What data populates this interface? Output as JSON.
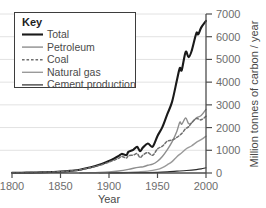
{
  "chart_data": {
    "type": "line",
    "title": "",
    "xlabel": "Year",
    "ylabel": "Million tonnes of carbon / year",
    "xlim": [
      1800,
      2000
    ],
    "ylim": [
      0,
      7000
    ],
    "xticks": [
      1800,
      1850,
      1900,
      1950,
      2000
    ],
    "yticks": [
      0,
      1000,
      2000,
      3000,
      4000,
      5000,
      6000,
      7000
    ],
    "grid": "horizontal",
    "legend_position": "top-left",
    "legend_title": "Key",
    "series": [
      {
        "name": "Total",
        "color": "#1a1a1a",
        "style": "solid",
        "width": 2.1,
        "x": [
          1800,
          1810,
          1820,
          1830,
          1840,
          1850,
          1860,
          1870,
          1880,
          1890,
          1900,
          1905,
          1910,
          1913,
          1918,
          1920,
          1925,
          1929,
          1932,
          1935,
          1940,
          1945,
          1950,
          1955,
          1960,
          1965,
          1970,
          1973,
          1975,
          1979,
          1982,
          1985,
          1990,
          1992,
          1995,
          2000
        ],
        "values": [
          8,
          12,
          18,
          27,
          42,
          60,
          95,
          145,
          240,
          360,
          530,
          630,
          750,
          840,
          790,
          930,
          1020,
          1150,
          960,
          1120,
          1300,
          1160,
          1630,
          2020,
          2580,
          3130,
          4080,
          4620,
          4530,
          5330,
          5100,
          5350,
          6150,
          6100,
          6400,
          6700
        ]
      },
      {
        "name": "Petroleum",
        "color": "#8e8e8e",
        "style": "solid",
        "width": 1.4,
        "x": [
          1870,
          1880,
          1890,
          1900,
          1910,
          1920,
          1930,
          1935,
          1940,
          1945,
          1950,
          1955,
          1960,
          1965,
          1970,
          1973,
          1975,
          1979,
          1982,
          1985,
          1990,
          1995,
          2000
        ],
        "values": [
          3,
          10,
          22,
          45,
          90,
          160,
          250,
          270,
          340,
          390,
          520,
          730,
          1020,
          1370,
          1840,
          2240,
          2150,
          2420,
          2180,
          2200,
          2420,
          2530,
          2800
        ]
      },
      {
        "name": "Coal",
        "color": "#6f6f6f",
        "style": "dashed",
        "width": 1.5,
        "x": [
          1800,
          1820,
          1840,
          1850,
          1860,
          1870,
          1880,
          1890,
          1900,
          1910,
          1913,
          1918,
          1920,
          1925,
          1929,
          1932,
          1935,
          1940,
          1945,
          1950,
          1955,
          1960,
          1965,
          1970,
          1975,
          1979,
          1982,
          1985,
          1990,
          1995,
          2000
        ],
        "values": [
          8,
          18,
          40,
          58,
          92,
          140,
          228,
          335,
          480,
          650,
          730,
          660,
          760,
          790,
          850,
          680,
          790,
          900,
          780,
          1060,
          1180,
          1400,
          1450,
          1570,
          1740,
          1950,
          2030,
          2200,
          2400,
          2340,
          2500
        ]
      },
      {
        "name": "Natural gas",
        "color": "#9a9a9a",
        "style": "solid",
        "width": 1.4,
        "x": [
          1890,
          1900,
          1910,
          1920,
          1930,
          1940,
          1950,
          1955,
          1960,
          1965,
          1970,
          1975,
          1980,
          1985,
          1990,
          1995,
          2000
        ],
        "values": [
          2,
          6,
          14,
          26,
          50,
          80,
          160,
          240,
          360,
          500,
          720,
          890,
          1080,
          1190,
          1350,
          1470,
          1620
        ]
      },
      {
        "name": "Cement production",
        "color": "#2b2b2b",
        "style": "solid",
        "width": 1.2,
        "x": [
          1900,
          1920,
          1940,
          1950,
          1960,
          1970,
          1980,
          1990,
          1995,
          2000
        ],
        "values": [
          5,
          12,
          20,
          28,
          50,
          80,
          110,
          150,
          180,
          230
        ]
      }
    ]
  },
  "axes": {
    "x_title": "Year",
    "y_title": "Million tonnes of carbon / year",
    "x_tick_labels": [
      "1800",
      "1850",
      "1900",
      "1950",
      "2000"
    ],
    "y_tick_labels": [
      "0",
      "1000",
      "2000",
      "3000",
      "4000",
      "5000",
      "6000",
      "7000"
    ]
  },
  "legend": {
    "title": "Key",
    "entries": [
      {
        "label": "Total"
      },
      {
        "label": "Petroleum"
      },
      {
        "label": "Coal"
      },
      {
        "label": "Natural gas"
      },
      {
        "label": "Cement production"
      }
    ]
  },
  "colors": {
    "axis": "#4d4d4d",
    "grid": "#e2e2e2",
    "tick_text": "#6d6d6d",
    "legend_border": "#3d3d3d",
    "background": "#ffffff"
  }
}
